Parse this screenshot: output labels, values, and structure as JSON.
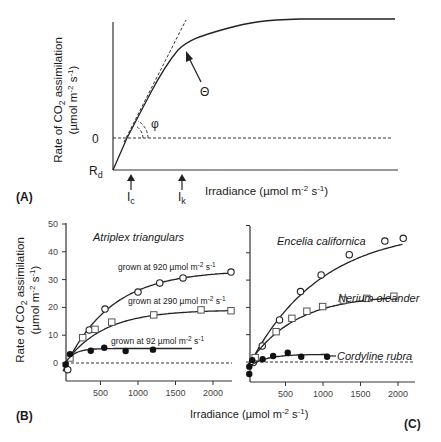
{
  "panels": {
    "A": {
      "label": "(A)",
      "ylabel_line1": "Rate of CO2 assimilation",
      "ylabel_line2": "(µmol m-2 s-1)",
      "y_zero": "0",
      "y_rd": "Rd",
      "xlabel": "Irradiance (µmol m-2 s-1)",
      "x_ic": "Ic",
      "x_ik": "Ik",
      "theta": "Θ",
      "phi": "φ"
    },
    "B": {
      "label": "(B)",
      "title": "Atriplex triangulars",
      "ylabel_line1": "Rate of CO2 assimilation",
      "ylabel_line2": "(µmol m-2 s-1)",
      "yticks": [
        "0",
        "10",
        "20",
        "30",
        "40",
        "50"
      ],
      "xticks": [
        "500",
        "1000",
        "1500",
        "2000"
      ]
    },
    "C": {
      "label": "(C)",
      "xticks": [
        "500",
        "1000",
        "1500",
        "2000"
      ]
    },
    "shared_xlabel": "Irradiance (µmol m-2 s-1)"
  },
  "chart_data": [
    {
      "type": "line",
      "title": "Conceptual light-response curve",
      "panel": "A",
      "xlabel": "Irradiance (µmol m-2 s-1)",
      "ylabel": "Rate of CO2 assimilation (µmol m-2 s-1)",
      "annotations": [
        "Rd (dark respiration, y-intercept)",
        "0 (dashed zero line)",
        "Ic (light compensation point)",
        "Ik (saturation onset)",
        "Θ (curvature)",
        "φ (initial slope / quantum yield, dashed tangent)"
      ],
      "grid": false
    },
    {
      "type": "scatter",
      "panel": "B",
      "title": "Atriplex triangulars",
      "xlabel": "Irradiance (µmol m-2 s-1)",
      "ylabel": "Rate of CO2 assimilation (µmol m-2 s-1)",
      "xlim": [
        0,
        2300
      ],
      "ylim": [
        -5,
        50
      ],
      "xticks": [
        500,
        1000,
        1500,
        2000
      ],
      "yticks": [
        0,
        10,
        20,
        30,
        40,
        50
      ],
      "grid": false,
      "series": [
        {
          "name": "grown at 920 µmol m-2 s-1",
          "marker": "open-circle",
          "x": [
            63,
            350,
            560,
            1000,
            1290,
            1600,
            2240
          ],
          "y": [
            -2.4,
            11.9,
            19.4,
            25.5,
            28.8,
            30.6,
            32.7
          ]
        },
        {
          "name": "grown at 290 µmol m-2 s-1",
          "marker": "open-square",
          "x": [
            93,
            263,
            427,
            650,
            1210,
            1840,
            2240
          ],
          "y": [
            1.8,
            9.1,
            12.1,
            14.7,
            17.3,
            19.1,
            18.8
          ]
        },
        {
          "name": "grown at 92 µmol m-2 s-1",
          "marker": "filled-circle",
          "x": [
            36,
            93,
            370,
            550,
            835,
            1200
          ],
          "y": [
            -0.5,
            3.2,
            4.4,
            5.5,
            4.3,
            4.8
          ]
        }
      ]
    },
    {
      "type": "scatter",
      "panel": "C",
      "xlabel": "Irradiance (µmol m-2 s-1)",
      "ylabel": "Rate of CO2 assimilation (µmol m-2 s-1)",
      "xlim": [
        0,
        2300
      ],
      "ylim": [
        -5,
        50
      ],
      "xticks": [
        500,
        1000,
        1500,
        2000
      ],
      "grid": false,
      "series": [
        {
          "name": "Encelia californica",
          "marker": "open-circle",
          "x": [
            70,
            190,
            420,
            700,
            975,
            1350,
            1825,
            2070
          ],
          "y": [
            -0.2,
            5.9,
            15.4,
            25.8,
            31.9,
            39.3,
            44.3,
            45.3
          ]
        },
        {
          "name": "Nerium oleander",
          "marker": "open-square",
          "x": [
            95,
            375,
            585,
            785,
            995,
            1270,
            1585,
            1945
          ],
          "y": [
            1.6,
            11.1,
            16.0,
            18.6,
            20.3,
            22.7,
            23.3,
            24.1
          ]
        },
        {
          "name": "Cordyline rubra",
          "marker": "filled-circle",
          "x": [
            17,
            17,
            57,
            195,
            335,
            530,
            710,
            1055
          ],
          "y": [
            -4.4,
            -1.7,
            0.7,
            1.0,
            2.2,
            3.4,
            1.9,
            1.9
          ]
        }
      ]
    }
  ]
}
